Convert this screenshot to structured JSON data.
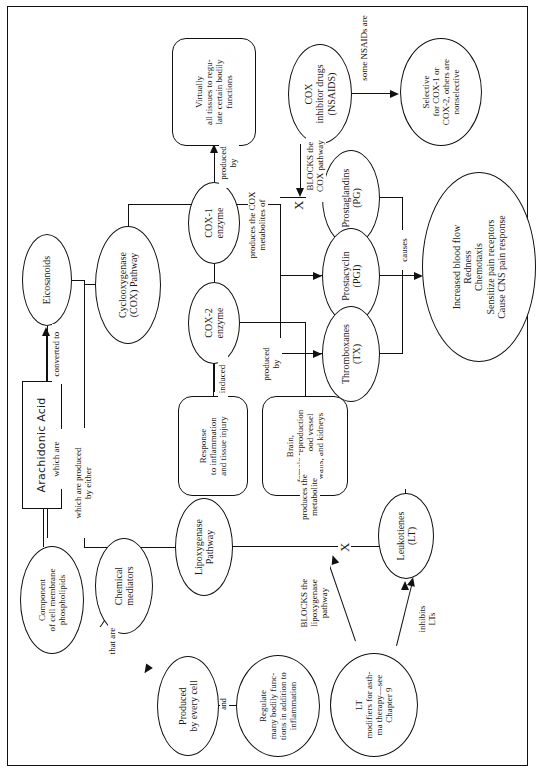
{
  "figure": {
    "orientation": "rotated-90-ccw",
    "ink_color": "#111111",
    "background": "#ffffff"
  },
  "nodes": {
    "arachidonic_acid": "Arachidonic Acid",
    "component": "Component\nof cell membrane\nphospholipids",
    "eicosanoids": "Eicosanoids",
    "chemical_mediators": "Chemical\nmediators",
    "produced_every_cell": "Produced\nby every cell",
    "regulate": "Regulate\nmany bodily func-\ntions in addition to\ninflammation",
    "lipoxygenase": "Lipoxygenase\nPathway",
    "lt_modifiers": "LT\nmodifiers for asth-\nma therapy—see\nChapter 9",
    "leukotrienes": "Leukotienes\n(LT)",
    "cox_pathway": "Cyclooxygenase\n(COX) Pathway",
    "cox1": "COX-1\nenzyme",
    "cox2": "COX-2\nenzyme",
    "response": "Response\nto inflammation\nand tissue injury",
    "brain": "Brain,\nfemale reproduction\ntract, blood vessel\nwalls, and kidneys",
    "virtually": "Virtually\nall tissues to regu-\nlate certain bodily\nfunctions",
    "cox_inhibitors": "COX\ninhibitor drugs\n(NSAIDS)",
    "selective": "Selective\nfor COX-1 or\nCOX-2, others are\nnonselective",
    "prostaglandins": "Prostaglandins\n(PG)",
    "prostacyclin": "Prostacyclin\n(PGI)",
    "thromboxanes": "Thromboxanes\n(TX)",
    "effects": "Increased blood flow\nRedness\nChemotaxis\nSensitize pain receptors\nCause CNS pain response"
  },
  "edge_labels": {
    "converted_to": "converted to",
    "which_are": "which are",
    "that_are": "that are",
    "and": "and",
    "which_are_produced_by_either": "which are produced\nby either",
    "produces_the_metabolite": "produces the\nmetabolite",
    "blocks_lipoxygenase": "BLOCKS the\nlipoxygenase\npathway",
    "inhibits_lts": "inhibits\nLTs",
    "induced": "induced",
    "produced_by_2": "produced\nby",
    "produced_by_1": "produced\nby",
    "produces_cox_metabolites": "produces the COX\nmetabolites of",
    "blocks_cox": "BLOCKS the\nCOX pathway",
    "some_nsaids_are": "some NSAIDs are",
    "causes": "causes"
  },
  "markers": {
    "block_x_lipoxygenase": "X",
    "block_x_cox": "X"
  }
}
